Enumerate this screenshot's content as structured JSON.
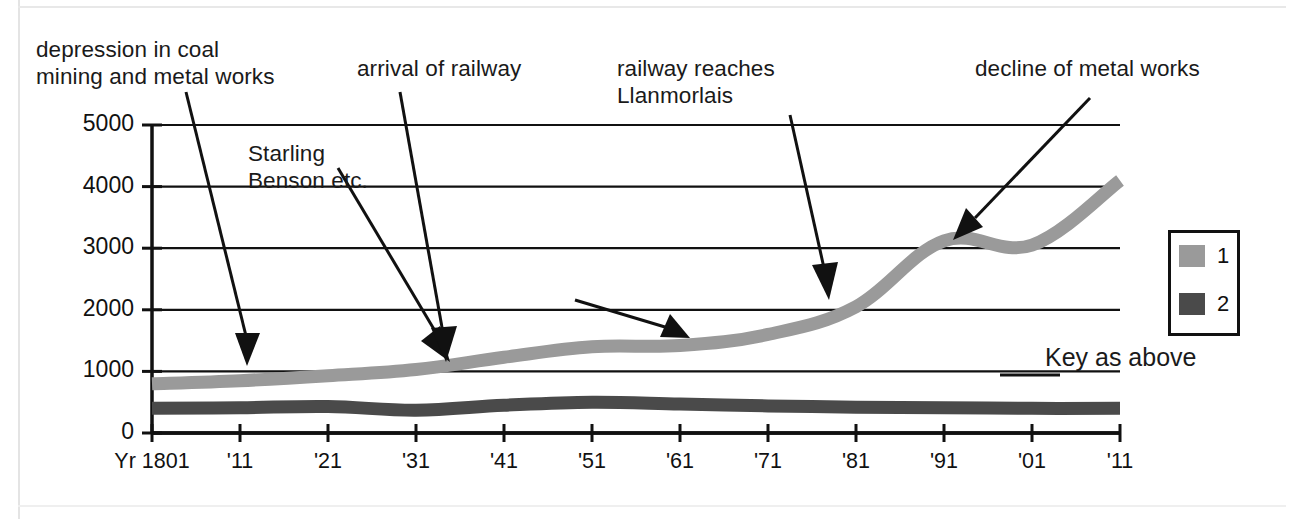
{
  "annotations": {
    "depression": "depression in coal\nmining and metal works",
    "starling": "Starling\nBenson etc.",
    "railway_arrival": "arrival of railway",
    "railway_llanmorlais": "railway reaches\nLlanmorlais",
    "decline": "decline of metal works"
  },
  "key_note": "Key as above",
  "legend": {
    "items": [
      {
        "label": "1",
        "color": "#9a9a9a"
      },
      {
        "label": "2",
        "color": "#4a4a4a"
      }
    ]
  },
  "chart_data": {
    "type": "line",
    "title": "",
    "xlabel": "",
    "ylabel": "",
    "ylim": [
      0,
      5000
    ],
    "yticks": [
      0,
      1000,
      2000,
      3000,
      4000,
      5000
    ],
    "ytick_labels": [
      "0",
      "1000",
      "2000",
      "3000",
      "4000",
      "5000"
    ],
    "grid": true,
    "legend_position": "right",
    "x": [
      1801,
      1811,
      1821,
      1831,
      1841,
      1851,
      1861,
      1871,
      1881,
      1891,
      1901,
      1911
    ],
    "xtick_labels": [
      "Yr 1801",
      "'11",
      "'21",
      "'31",
      "'41",
      "'51",
      "'61",
      "'71",
      "'81",
      "'91",
      "'01",
      "'11"
    ],
    "series": [
      {
        "name": "1",
        "color": "#9a9a9a",
        "values": [
          800,
          850,
          930,
          1030,
          1230,
          1400,
          1420,
          1600,
          2050,
          3120,
          3050,
          4100
        ]
      },
      {
        "name": "2",
        "color": "#4a4a4a",
        "values": [
          400,
          410,
          430,
          370,
          450,
          500,
          470,
          440,
          420,
          410,
          400,
          400
        ]
      }
    ]
  }
}
